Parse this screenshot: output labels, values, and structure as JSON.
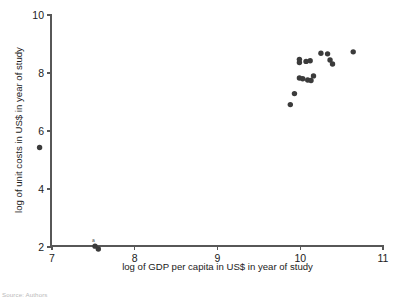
{
  "chart_data": {
    "type": "scatter",
    "title": "",
    "xlabel": "log of GDP per capita in US$ in year of study",
    "ylabel": "log of unit costs in US$ in year of study",
    "xlim": [
      6.7,
      11.0
    ],
    "ylim": [
      1.6,
      10.0
    ],
    "xticks": [
      7,
      8,
      9,
      10,
      11
    ],
    "yticks": [
      2,
      4,
      6,
      8,
      10
    ],
    "xtick_labels": [
      "7",
      "8",
      "9",
      "10",
      "11"
    ],
    "ytick_labels": [
      "2",
      "4",
      "6",
      "8",
      "10"
    ],
    "grid": false,
    "legend": null,
    "marker": "filled-circle",
    "marker_color": "#3b3b3b",
    "points": [
      {
        "x": 6.85,
        "y": 5.43
      },
      {
        "x": 7.52,
        "y": 2.03
      },
      {
        "x": 7.56,
        "y": 1.93
      },
      {
        "x": 9.88,
        "y": 6.91
      },
      {
        "x": 9.93,
        "y": 7.29
      },
      {
        "x": 9.99,
        "y": 7.83
      },
      {
        "x": 10.03,
        "y": 7.8
      },
      {
        "x": 9.99,
        "y": 8.36
      },
      {
        "x": 9.99,
        "y": 8.47
      },
      {
        "x": 10.07,
        "y": 8.4
      },
      {
        "x": 10.12,
        "y": 8.42
      },
      {
        "x": 10.09,
        "y": 7.76
      },
      {
        "x": 10.13,
        "y": 7.74
      },
      {
        "x": 10.16,
        "y": 7.9
      },
      {
        "x": 10.25,
        "y": 8.68
      },
      {
        "x": 10.33,
        "y": 8.66
      },
      {
        "x": 10.36,
        "y": 8.45
      },
      {
        "x": 10.39,
        "y": 8.31
      },
      {
        "x": 10.64,
        "y": 8.73
      }
    ],
    "annotations": [
      {
        "text": "a",
        "x": 7.5,
        "y": 2.17,
        "role": "footnote-marker"
      }
    ]
  },
  "footer": {
    "source_note": "Source: Authors"
  }
}
